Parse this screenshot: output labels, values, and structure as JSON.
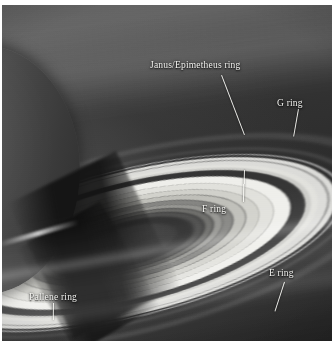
{
  "figure": {
    "background_color": "#ffffff",
    "plate_color": "#2e2e2e"
  },
  "annotations": [
    {
      "id": "janus-epimetheus-ring",
      "label": "Janus/Epimetheus ring",
      "label_x": 148,
      "label_y": 55,
      "leader": {
        "x": 220,
        "y": 70,
        "length": 64,
        "angle": 69
      }
    },
    {
      "id": "g-ring",
      "label": "G ring",
      "label_x": 275,
      "label_y": 93,
      "leader": {
        "x": 297,
        "y": 104,
        "length": 28,
        "angle": 100
      }
    },
    {
      "id": "f-ring",
      "label": "F ring",
      "label_x": 200,
      "label_y": 199,
      "leader": {
        "x": 243,
        "y": 165,
        "length": 32,
        "angle": 92
      }
    },
    {
      "id": "e-ring",
      "label": "E ring",
      "label_x": 267,
      "label_y": 263,
      "leader": {
        "x": 283,
        "y": 277,
        "length": 31,
        "angle": 108
      }
    },
    {
      "id": "pallene-ring",
      "label": "Pallene ring",
      "label_x": 27,
      "label_y": 287,
      "leader": {
        "x": 52,
        "y": 298,
        "length": 17,
        "angle": 91
      }
    }
  ],
  "rings_depicted": [
    "D ring",
    "C ring",
    "B ring",
    "Cassini division",
    "A ring",
    "Encke gap",
    "F ring",
    "Janus/Epimetheus ring",
    "G ring",
    "Pallene ring",
    "E ring"
  ],
  "colors": {
    "label_text": "#f2f2ef",
    "leader_line": "#f6f6f3",
    "bright_ring": "#f7f7f3",
    "dark_gap": "#343434",
    "space": "#232323"
  }
}
